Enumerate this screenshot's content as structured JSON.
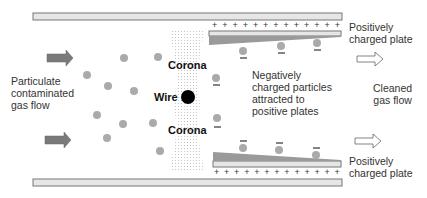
{
  "labels": {
    "inlet": [
      "Particulate",
      "contaminated",
      "gas flow"
    ],
    "wire": "Wire",
    "corona_top": "Corona",
    "corona_bottom": "Corona",
    "middle": [
      "Negatively",
      "charged particles",
      "attracted to",
      "positive plates"
    ],
    "outlet": [
      "Cleaned",
      "gas flow"
    ],
    "top_plate": [
      "Positively",
      "charged plate"
    ],
    "bottom_plate": [
      "Positively",
      "charged plate"
    ]
  },
  "plates": {
    "plus_count": 13,
    "plus_symbol": "+",
    "minus_symbol": "−"
  },
  "colors": {
    "plate_fill": "#e6e6e6",
    "plate_border": "#777777",
    "collected_dust": "#9a9a9a",
    "particle": "#aaaaaa",
    "inlet_arrow": "#7a7a7a",
    "wire": "#000000",
    "corona_dots": "#c8c8c8"
  }
}
